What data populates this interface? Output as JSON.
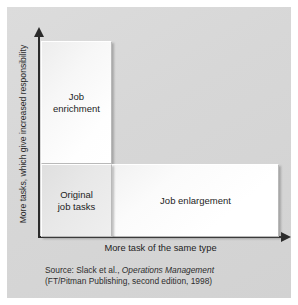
{
  "chart_data": {
    "type": "diagram",
    "subtype": "quadrant-matrix",
    "title": "",
    "xlabel": "More task of the same type",
    "ylabel": "More tasks, which give increased responsibility",
    "grid": false,
    "legend": "none",
    "axes": {
      "x": {
        "arrow": true,
        "direction": "right",
        "ticks": []
      },
      "y": {
        "arrow": true,
        "direction": "up",
        "ticks": []
      }
    },
    "boxes": [
      {
        "id": "original",
        "label": "Original\njob tasks",
        "position": "bottom-left",
        "fill": "#e8e8e8",
        "x": 0,
        "y": 0,
        "width": 1,
        "height": 1
      },
      {
        "id": "enrichment",
        "label": "Job\nenrichment",
        "position": "top-left",
        "fill": "#fafafa",
        "x": 0,
        "y": 1,
        "width": 1,
        "height": 1.7
      },
      {
        "id": "enlargement",
        "label": "Job enlargement",
        "position": "bottom-right",
        "fill": "#fdfdfd",
        "x": 1,
        "y": 0,
        "width": 2.35,
        "height": 1
      }
    ],
    "colors": {
      "panel_background": "#d7d7d7",
      "axis": "#2b2b2b",
      "text": "#1d1d1d"
    }
  },
  "figure": {
    "axes": {
      "y_label": "More tasks, which give increased responsibility",
      "x_label": "More task of the same type"
    },
    "boxes": {
      "enrichment": "Job\nenrichment",
      "original": "Original\njob tasks",
      "enlargement": "Job enlargement"
    },
    "source": {
      "line1_prefix": "Source: Slack et al., ",
      "line1_title": "Operations Management",
      "line2": "(FT/Pitman Publishing, second edition, 1998)"
    }
  }
}
